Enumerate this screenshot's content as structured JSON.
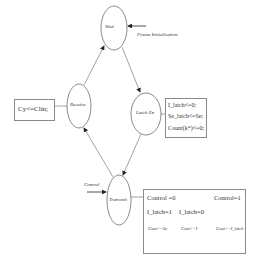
{
  "diagram": {
    "states": [
      {
        "id": "wait",
        "label": "Wait"
      },
      {
        "id": "latch_en",
        "label": "Latch En"
      },
      {
        "id": "receive",
        "label": "Receive"
      },
      {
        "id": "transmit",
        "label": "Transmit"
      }
    ],
    "inputs": {
      "frame_init": "Frame Initialization",
      "control": "Control"
    },
    "receive_box": {
      "lines": [
        "Cy<=Clin;"
      ]
    },
    "latch_box": {
      "lines": [
        "I_latch<=0;",
        "Se_latch<=Se;",
        "Count(k*)<=0;"
      ]
    },
    "transmit_box": {
      "control0": "Control =0",
      "control1": "Control=1",
      "ilatch1": "I_latch=1",
      "ilatch0": "I_latch=0",
      "cout_se": "Cout<=Se",
      "cout_i": "Cout<=I",
      "cout_ilatch": "Cout<=I_latch"
    },
    "transitions": [
      {
        "from": "wait",
        "to": "latch_en"
      },
      {
        "from": "latch_en",
        "to": "transmit"
      },
      {
        "from": "transmit",
        "to": "receive"
      },
      {
        "from": "receive",
        "to": "wait"
      }
    ],
    "colors": {
      "stroke": "#8a8a8a",
      "text": "#333333",
      "background": "#ffffff"
    }
  }
}
